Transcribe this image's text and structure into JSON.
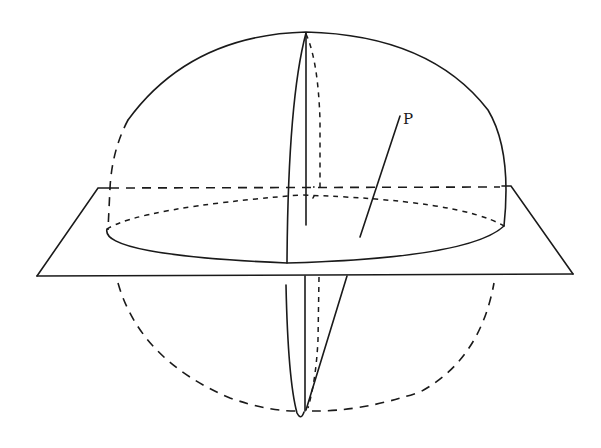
{
  "figure": {
    "labels": {
      "point_p": "P"
    },
    "colors": {
      "ink": "#1a1a1a",
      "background": "#ffffff"
    }
  }
}
